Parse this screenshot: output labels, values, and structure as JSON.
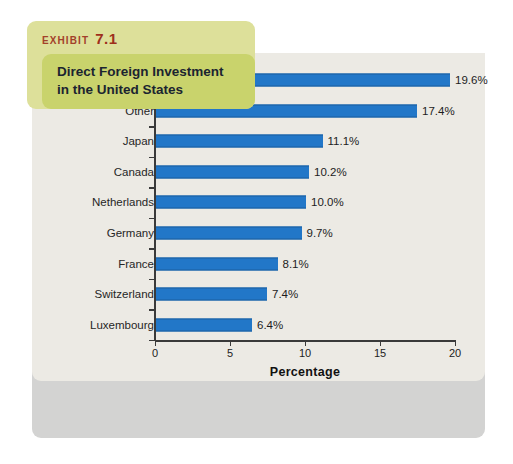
{
  "exhibit": {
    "eyebrow_word": "EXHIBIT",
    "eyebrow_number": "7.1",
    "title_line1": "Direct Foreign Investment",
    "title_line2": "in the United States",
    "banner_color": "#dde09a",
    "banner_inner_color": "#c9d36c",
    "eyebrow_color": "#a3412a",
    "card_color": "#d3d3d2",
    "plot_bg_color": "#eceae4"
  },
  "chart_data": {
    "type": "bar",
    "orientation": "horizontal",
    "title": "Direct Foreign Investment in the United States",
    "xlabel": "Percentage",
    "ylabel": "",
    "xlim": [
      0,
      20
    ],
    "xticks": [
      0,
      5,
      10,
      15,
      20
    ],
    "xtick_labels": [
      "0",
      "5",
      "10",
      "15",
      "20"
    ],
    "grid": false,
    "legend": false,
    "bar_color": "#2277c8",
    "bar_edge_color": "#1b5f9e",
    "categories": [
      "United Kingdom",
      "Other",
      "Japan",
      "Canada",
      "Netherlands",
      "Germany",
      "France",
      "Switzerland",
      "Luxembourg"
    ],
    "values": [
      19.6,
      17.4,
      11.1,
      10.2,
      10.0,
      9.7,
      8.1,
      7.4,
      6.4
    ],
    "value_labels": [
      "19.6%",
      "17.4%",
      "11.1%",
      "10.2%",
      "10.0%",
      "9.7%",
      "8.1%",
      "7.4%",
      "6.4%"
    ]
  }
}
